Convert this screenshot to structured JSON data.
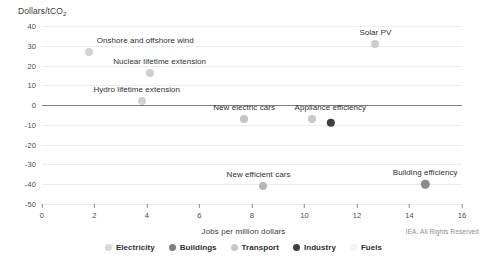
{
  "chart_data": {
    "type": "scatter",
    "title": "",
    "xlabel": "Jobs per million dollars",
    "ylabel": "Dollars/tCO2",
    "ylabel_main": "Dollars/tCO",
    "ylabel_sub": "2",
    "xlim": [
      0,
      16
    ],
    "ylim": [
      -50,
      40
    ],
    "xticks": [
      0,
      2,
      4,
      6,
      8,
      10,
      12,
      14,
      16
    ],
    "yticks": [
      40,
      30,
      20,
      10,
      0,
      -10,
      -20,
      -30,
      -40,
      -50
    ],
    "grid": "horizontal",
    "legend_position": "bottom",
    "series": [
      {
        "name": "Electricity",
        "color": "#d9d9d9"
      },
      {
        "name": "Buildings",
        "color": "#808080"
      },
      {
        "name": "Transport",
        "color": "#bfbfbf"
      },
      {
        "name": "Industry",
        "color": "#404040"
      },
      {
        "name": "Fuels",
        "color": "#f2f2f2"
      }
    ],
    "points": [
      {
        "label": "Onshore and offshore wind",
        "x": 1.8,
        "y": 27,
        "series": "Electricity",
        "color": "#d2d2d2",
        "r": 4.0,
        "label_dx": 56,
        "label_dy": -12
      },
      {
        "label": "Nuclear lifetime extension",
        "x": 4.1,
        "y": 16,
        "series": "Electricity",
        "color": "#cfcfcf",
        "r": 4.0,
        "label_dx": 10,
        "label_dy": -12
      },
      {
        "label": "Hydro lifetime extension",
        "x": 3.8,
        "y": 2,
        "series": "Electricity",
        "color": "#d2d2d2",
        "r": 4.0,
        "label_dx": -5,
        "label_dy": -12
      },
      {
        "label": "Solar PV",
        "x": 12.7,
        "y": 31,
        "series": "Electricity",
        "color": "#cdcdcd",
        "r": 4.0,
        "label_dx": 0,
        "label_dy": -12
      },
      {
        "label": "New electric cars",
        "x": 7.7,
        "y": -7,
        "series": "Transport",
        "color": "#c4c4c4",
        "r": 4.0,
        "label_dx": 0,
        "label_dy": -12
      },
      {
        "label": "Appliance efficiency",
        "x": 10.3,
        "y": -7,
        "series": "Buildings",
        "color": "#c9c9c9",
        "r": 4.0,
        "label_dx": 18,
        "label_dy": -12
      },
      {
        "label": "",
        "x": 11.0,
        "y": -9,
        "series": "Industry",
        "color": "#3f3f3f",
        "r": 4.2,
        "label_dx": 0,
        "label_dy": 0
      },
      {
        "label": "New efficient cars",
        "x": 8.4,
        "y": -41,
        "series": "Transport",
        "color": "#b6b6b6",
        "r": 4.0,
        "label_dx": -4,
        "label_dy": -12
      },
      {
        "label": "Building efficiency",
        "x": 14.6,
        "y": -40,
        "series": "Buildings",
        "color": "#8c8c8c",
        "r": 4.2,
        "label_dx": 0,
        "label_dy": -12
      }
    ]
  },
  "legend": {
    "items": [
      {
        "label": "Electricity",
        "color": "#d9d9d9"
      },
      {
        "label": "Buildings",
        "color": "#7f7f7f"
      },
      {
        "label": "Transport",
        "color": "#c6c6c6"
      },
      {
        "label": "Industry",
        "color": "#3f3f3f"
      },
      {
        "label": "Fuels",
        "color": "#f4f4f4"
      }
    ]
  },
  "footer": {
    "copyright": "IEA. All Rights Reserved"
  }
}
